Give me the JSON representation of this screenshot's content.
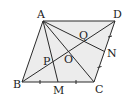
{
  "diagram": {
    "type": "geometry",
    "shape": "parallelogram",
    "fill_color": "#ececec",
    "line_color": "#2a2a2a",
    "points": {
      "A": {
        "label": "A",
        "x": 43,
        "y": 21
      },
      "D": {
        "label": "D",
        "x": 115,
        "y": 21
      },
      "B": {
        "label": "B",
        "x": 22,
        "y": 82
      },
      "C": {
        "label": "C",
        "x": 94,
        "y": 82
      },
      "M": {
        "label": "M",
        "x": 58,
        "y": 82
      },
      "N": {
        "label": "N",
        "x": 104.5,
        "y": 51.5
      },
      "O": {
        "label": "O",
        "x": 68.5,
        "y": 51.5
      },
      "P": {
        "label": "P",
        "x": 52,
        "y": 61
      },
      "Q": {
        "label": "Q",
        "x": 83,
        "y": 41
      }
    },
    "segments": [
      "AB",
      "BC",
      "CD",
      "DA",
      "AC",
      "BD",
      "AM",
      "AN"
    ],
    "tick_marks": [
      "BM",
      "MC",
      "CN",
      "ND"
    ]
  }
}
